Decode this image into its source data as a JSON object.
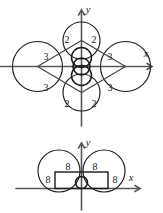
{
  "page": {
    "background_color": "#ffffff",
    "ink_color": "#1b1b1b",
    "axis_color": "#58585a"
  },
  "figures": [
    {
      "id": "top-figure",
      "name": "rhombus-with-four-large-and-four-small-circles",
      "axes": {
        "x_label": "x",
        "y_label": "y"
      },
      "labels": [
        {
          "text": "2",
          "role": "upper-left-small-circle"
        },
        {
          "text": "2",
          "role": "upper-right-small-circle"
        },
        {
          "text": "3",
          "role": "upper-left-large-circle"
        },
        {
          "text": "3",
          "role": "upper-right-large-circle"
        },
        {
          "text": "3",
          "role": "lower-left-large-circle"
        },
        {
          "text": "3",
          "role": "lower-right-large-circle"
        },
        {
          "text": "2",
          "role": "lower-left-small-circle"
        },
        {
          "text": "2",
          "role": "lower-right-small-circle"
        }
      ]
    },
    {
      "id": "bottom-figure",
      "name": "two-circles-with-rectangle-and-small-circle",
      "axes": {
        "x_label": "x",
        "y_label": "y"
      },
      "labels": [
        {
          "text": "8",
          "role": "top-left-inside-circle"
        },
        {
          "text": "8",
          "role": "top-right-inside-circle"
        },
        {
          "text": "8",
          "role": "left-outside-rectangle"
        },
        {
          "text": "8",
          "role": "right-outside-rectangle"
        }
      ]
    }
  ]
}
